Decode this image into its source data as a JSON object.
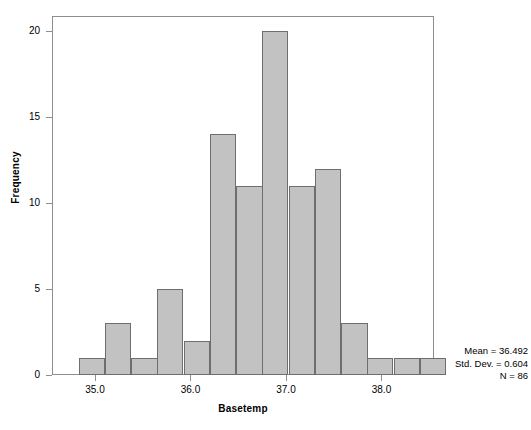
{
  "chart_data": {
    "type": "bar",
    "title": "",
    "subtitle": "",
    "xlabel": "Basetemp",
    "ylabel": "Frequency",
    "grid": false,
    "legend": null,
    "xlim": [
      34.55,
      38.55
    ],
    "ylim": [
      0,
      21
    ],
    "bin_width": 0.275,
    "x_ticks": [
      "35.0",
      "36.0",
      "37.0",
      "38.0"
    ],
    "x_tick_values": [
      35.0,
      36.0,
      37.0,
      38.0
    ],
    "y_ticks": [
      "0",
      "5",
      "10",
      "15",
      "20"
    ],
    "y_tick_values": [
      0,
      5,
      10,
      15,
      20
    ],
    "bin_starts": [
      34.83,
      35.1,
      35.38,
      35.65,
      35.93,
      36.2,
      36.48,
      36.75,
      37.03,
      37.3,
      37.58,
      37.85,
      38.13,
      38.4
    ],
    "categories": [
      "34.83-35.10",
      "35.10-35.38",
      "35.38-35.65",
      "35.65-35.93",
      "35.93-36.20",
      "36.20-36.48",
      "36.48-36.75",
      "36.75-37.03",
      "37.03-37.30",
      "37.30-37.58",
      "37.58-37.85",
      "37.85-38.13",
      "38.13-38.40",
      "38.40-38.68"
    ],
    "values": [
      1,
      3,
      1,
      5,
      2,
      14,
      11,
      20,
      11,
      12,
      3,
      1,
      1,
      1
    ],
    "bar_fill_color": "#c2c2c2",
    "bar_edge_color": "#6e6e6e",
    "annotations": [
      "Mean = 36.492",
      "Std. Dev. = 0.604",
      "N = 86"
    ]
  },
  "stats": {
    "mean": "Mean = 36.492",
    "std_dev": "Std. Dev. = 0.604",
    "n": "N = 86"
  },
  "axes": {
    "x_title": "Basetemp",
    "y_title": "Frequency"
  }
}
